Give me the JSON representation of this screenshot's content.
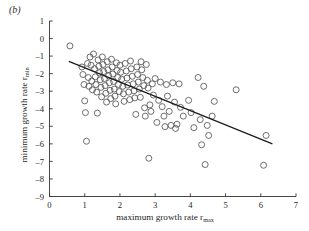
{
  "figure": {
    "panel_label": "(b)",
    "background_color": "#ffffff",
    "ink_color": "#333333"
  },
  "chart_data": {
    "type": "scatter",
    "title": "",
    "panel": "(b)",
    "xlabel": "maximum growth rate r",
    "xlabel_subscript": "max",
    "ylabel": "minimum growth rate r",
    "ylabel_subscript": "min",
    "xlim": [
      0,
      7
    ],
    "ylim": [
      -9,
      1
    ],
    "xticks": [
      0,
      1,
      2,
      3,
      4,
      5,
      6,
      7
    ],
    "xticklabels": [
      "0",
      "1",
      "2",
      "3",
      "4",
      "5",
      "6",
      "7"
    ],
    "yticks": [
      1,
      0,
      -1,
      -2,
      -3,
      -4,
      -5,
      -6,
      -7,
      -8,
      -9
    ],
    "yticklabels": [
      "1",
      "0",
      "-1",
      "-2",
      "-3",
      "-4",
      "-5",
      "-6",
      "-7",
      "-8",
      "-9"
    ],
    "grid": false,
    "legend": false,
    "marker": "open-circle",
    "marker_size": 3.0,
    "marker_color": "#555555",
    "line_color": "#1a1a1a",
    "fit_line": {
      "label": "linear regression fit",
      "x": [
        0.55,
        6.33
      ],
      "y": [
        -1.3,
        -6.0
      ]
    },
    "points": [
      [
        0.58,
        -0.42
      ],
      [
        0.92,
        -1.62
      ],
      [
        0.95,
        -2.05
      ],
      [
        0.98,
        -2.62
      ],
      [
        1.0,
        -3.55
      ],
      [
        1.02,
        -4.22
      ],
      [
        1.05,
        -5.85
      ],
      [
        1.08,
        -1.42
      ],
      [
        1.1,
        -2.22
      ],
      [
        1.12,
        -2.72
      ],
      [
        1.15,
        -1.05
      ],
      [
        1.18,
        -1.52
      ],
      [
        1.2,
        -2.42
      ],
      [
        1.22,
        -2.92
      ],
      [
        1.25,
        -0.88
      ],
      [
        1.28,
        -1.72
      ],
      [
        1.3,
        -2.18
      ],
      [
        1.32,
        -2.62
      ],
      [
        1.34,
        -3.05
      ],
      [
        1.36,
        -4.25
      ],
      [
        1.38,
        -1.22
      ],
      [
        1.4,
        -1.58
      ],
      [
        1.42,
        -1.95
      ],
      [
        1.44,
        -2.35
      ],
      [
        1.46,
        -2.78
      ],
      [
        1.48,
        -3.32
      ],
      [
        1.5,
        -1.05
      ],
      [
        1.52,
        -1.48
      ],
      [
        1.54,
        -1.88
      ],
      [
        1.56,
        -2.28
      ],
      [
        1.58,
        -2.68
      ],
      [
        1.6,
        -3.12
      ],
      [
        1.62,
        -3.62
      ],
      [
        1.64,
        -1.32
      ],
      [
        1.66,
        -1.78
      ],
      [
        1.68,
        -2.12
      ],
      [
        1.7,
        -2.52
      ],
      [
        1.72,
        -2.95
      ],
      [
        1.74,
        -3.42
      ],
      [
        1.76,
        -1.18
      ],
      [
        1.78,
        -1.62
      ],
      [
        1.8,
        -2.02
      ],
      [
        1.82,
        -2.45
      ],
      [
        1.84,
        -2.88
      ],
      [
        1.86,
        -3.28
      ],
      [
        1.88,
        -3.72
      ],
      [
        1.9,
        -1.38
      ],
      [
        1.92,
        -1.82
      ],
      [
        1.94,
        -2.22
      ],
      [
        1.96,
        -2.62
      ],
      [
        1.98,
        -3.02
      ],
      [
        2.0,
        -1.52
      ],
      [
        2.02,
        -1.92
      ],
      [
        2.05,
        -2.32
      ],
      [
        2.08,
        -2.72
      ],
      [
        2.1,
        -3.15
      ],
      [
        2.12,
        -3.58
      ],
      [
        2.15,
        -1.42
      ],
      [
        2.18,
        -1.85
      ],
      [
        2.2,
        -2.25
      ],
      [
        2.22,
        -2.65
      ],
      [
        2.25,
        -3.05
      ],
      [
        2.28,
        -3.48
      ],
      [
        2.3,
        -1.28
      ],
      [
        2.32,
        -1.72
      ],
      [
        2.35,
        -2.15
      ],
      [
        2.38,
        -2.58
      ],
      [
        2.4,
        -2.98
      ],
      [
        2.42,
        -3.38
      ],
      [
        2.45,
        -4.32
      ],
      [
        2.48,
        -1.62
      ],
      [
        2.5,
        -2.05
      ],
      [
        2.52,
        -2.48
      ],
      [
        2.55,
        -2.88
      ],
      [
        2.58,
        -3.35
      ],
      [
        2.6,
        -1.32
      ],
      [
        2.62,
        -1.78
      ],
      [
        2.65,
        -2.22
      ],
      [
        2.68,
        -2.68
      ],
      [
        2.7,
        -3.95
      ],
      [
        2.72,
        -4.42
      ],
      [
        2.75,
        -1.48
      ],
      [
        2.78,
        -2.38
      ],
      [
        2.8,
        -2.82
      ],
      [
        2.82,
        -6.82
      ],
      [
        2.85,
        -3.78
      ],
      [
        2.88,
        -4.15
      ],
      [
        2.92,
        -2.58
      ],
      [
        2.95,
        -3.22
      ],
      [
        3.0,
        -2.28
      ],
      [
        3.05,
        -4.78
      ],
      [
        3.1,
        -3.52
      ],
      [
        3.15,
        -2.48
      ],
      [
        3.2,
        -3.88
      ],
      [
        3.25,
        -4.42
      ],
      [
        3.28,
        -5.02
      ],
      [
        3.32,
        -2.62
      ],
      [
        3.35,
        -3.28
      ],
      [
        3.4,
        -4.15
      ],
      [
        3.45,
        -4.95
      ],
      [
        3.5,
        -2.52
      ],
      [
        3.55,
        -3.62
      ],
      [
        3.58,
        -5.12
      ],
      [
        3.62,
        -4.88
      ],
      [
        3.68,
        -2.58
      ],
      [
        3.72,
        -3.92
      ],
      [
        3.8,
        -4.42
      ],
      [
        3.95,
        -3.52
      ],
      [
        4.02,
        -4.22
      ],
      [
        4.1,
        -5.08
      ],
      [
        4.22,
        -2.22
      ],
      [
        4.28,
        -4.62
      ],
      [
        4.32,
        -6.05
      ],
      [
        4.38,
        -2.72
      ],
      [
        4.42,
        -7.18
      ],
      [
        4.48,
        -4.95
      ],
      [
        4.52,
        -5.52
      ],
      [
        4.62,
        -4.42
      ],
      [
        4.68,
        -3.58
      ],
      [
        5.3,
        -2.92
      ],
      [
        6.08,
        -7.22
      ],
      [
        6.15,
        -5.52
      ]
    ]
  }
}
